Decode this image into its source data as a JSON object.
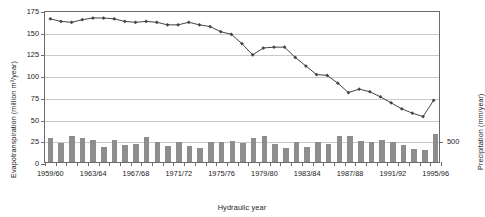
{
  "chart_data": {
    "type": "line",
    "title": "",
    "xlabel": "Hydraulic year",
    "ylabel_left": "Evapotranspiration (million m³/year)",
    "ylabel_right": "Precipitation (mm/year)",
    "ylim_left": [
      0,
      175
    ],
    "yticks_left": [
      0,
      25,
      50,
      75,
      100,
      125,
      150,
      175
    ],
    "ylim_right": [
      0,
      3500
    ],
    "yticks_right": [
      500
    ],
    "yticklabels_right": [
      "500"
    ],
    "grid": true,
    "legend_position": "none",
    "categories": [
      "1959/60",
      "1960/61",
      "1961/62",
      "1962/63",
      "1963/64",
      "1964/65",
      "1965/66",
      "1966/67",
      "1967/68",
      "1968/69",
      "1969/70",
      "1970/71",
      "1971/72",
      "1972/73",
      "1973/74",
      "1974/75",
      "1975/76",
      "1976/77",
      "1977/78",
      "1978/79",
      "1979/80",
      "1980/81",
      "1981/82",
      "1982/83",
      "1983/84",
      "1984/85",
      "1985/86",
      "1986/87",
      "1987/88",
      "1988/89",
      "1989/90",
      "1990/91",
      "1991/92",
      "1992/93",
      "1993/94",
      "1994/95",
      "1995/96"
    ],
    "xticklabels": [
      "1959/60",
      "1963/64",
      "1967/68",
      "1971/72",
      "1975/76",
      "1979/80",
      "1983/84",
      "1987/88",
      "1991/92",
      "1995/96"
    ],
    "xticklabel_indices": [
      0,
      4,
      8,
      12,
      16,
      20,
      24,
      28,
      32,
      36
    ],
    "series": [
      {
        "name": "Evapotranspiration",
        "type": "line",
        "axis": "left",
        "marker": "diamond",
        "color": "#454545",
        "values": [
          167,
          164,
          163,
          166,
          168,
          168,
          167,
          164,
          163,
          164,
          163,
          160,
          160,
          163,
          160,
          158,
          152,
          149,
          138,
          125,
          133,
          134,
          134,
          122,
          112,
          102,
          101,
          92,
          81,
          85,
          82,
          76,
          69,
          62,
          57,
          53,
          72
        ]
      },
      {
        "name": "Precipitation",
        "type": "bar",
        "axis": "right",
        "color": "#8d8d8d",
        "values": [
          280,
          215,
          295,
          280,
          250,
          175,
          250,
          200,
          210,
          290,
          225,
          185,
          235,
          180,
          165,
          230,
          235,
          240,
          215,
          275,
          295,
          205,
          160,
          225,
          175,
          235,
          210,
          295,
          300,
          245,
          225,
          250,
          225,
          195,
          155,
          140,
          320
        ],
        "values_note": "Bar heights expressed on the left-hand scale (million m³/year) as drawn"
      }
    ]
  }
}
